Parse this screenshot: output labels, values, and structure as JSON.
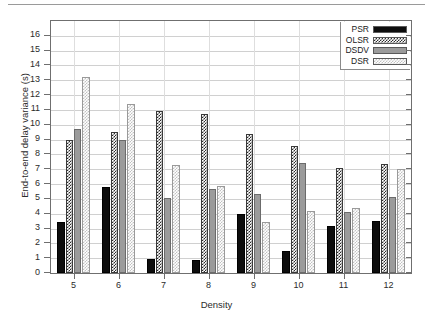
{
  "chart_data": {
    "type": "bar",
    "title": "",
    "xlabel": "Density",
    "ylabel": "End-to-end delay variance (s)",
    "categories": [
      "5",
      "6",
      "7",
      "8",
      "9",
      "10",
      "11",
      "12"
    ],
    "ylim": [
      0,
      17
    ],
    "yticks": [
      0,
      1,
      2,
      3,
      4,
      5,
      6,
      7,
      8,
      9,
      10,
      11,
      12,
      13,
      14,
      15,
      16
    ],
    "grid": true,
    "legend_position": "top-right",
    "series": [
      {
        "name": "PSR",
        "values": [
          3.45,
          5.8,
          0.95,
          0.88,
          4.0,
          1.5,
          3.15,
          3.5
        ]
      },
      {
        "name": "OLSR",
        "values": [
          8.95,
          9.5,
          10.95,
          10.75,
          9.35,
          8.6,
          7.1,
          7.35
        ]
      },
      {
        "name": "DSDV",
        "values": [
          9.7,
          8.95,
          5.05,
          5.7,
          5.35,
          7.45,
          4.1,
          5.1
        ]
      },
      {
        "name": "DSR",
        "values": [
          13.25,
          11.4,
          7.3,
          5.85,
          3.45,
          4.2,
          4.4,
          7.0
        ]
      }
    ]
  },
  "legend": {
    "entries": [
      {
        "label": "PSR",
        "pattern": "solid-black"
      },
      {
        "label": "OLSR",
        "pattern": "dense-crosshatch"
      },
      {
        "label": "DSDV",
        "pattern": "solid-gray"
      },
      {
        "label": "DSR",
        "pattern": "light-dotted"
      }
    ]
  }
}
